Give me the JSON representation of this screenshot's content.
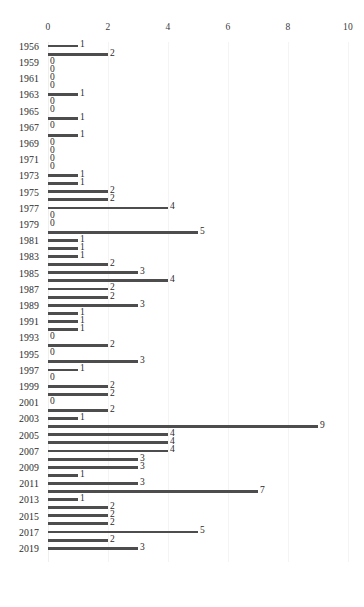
{
  "chart_data": {
    "type": "bar",
    "orientation": "horizontal",
    "title": "",
    "subtitle": "",
    "xlabel": "",
    "ylabel": "",
    "xlim": [
      0,
      10
    ],
    "ylim": null,
    "grid": true,
    "grid_axis": "x",
    "legend": null,
    "legend_position": "none",
    "xticks": [
      0,
      2,
      4,
      6,
      8,
      10
    ],
    "xtick_labels": [
      "0",
      "2",
      "4",
      "6",
      "8",
      "10"
    ],
    "bar_color": "#4d4d4d",
    "gridline_color": "#f4f4f4",
    "axis_color": "#efefef",
    "text_color": "#2b2b2b",
    "categories": [
      "1956",
      "1957",
      "1959",
      "1960",
      "1961",
      "1962",
      "1963",
      "1964",
      "1965",
      "1966",
      "1967",
      "1968",
      "1969",
      "1970",
      "1971",
      "1972",
      "1973",
      "1974",
      "1975",
      "1976",
      "1977",
      "1978",
      "1979",
      "1980",
      "1981",
      "1982",
      "1983",
      "1984",
      "1985",
      "1986",
      "1987",
      "1988",
      "1989",
      "1990",
      "1991",
      "1992",
      "1993",
      "1994",
      "1995",
      "1996",
      "1997",
      "1998",
      "1999",
      "2000",
      "2001",
      "2002",
      "2003",
      "2004",
      "2005",
      "2006",
      "2007",
      "2008",
      "2009",
      "2010",
      "2011",
      "2012",
      "2013",
      "2014",
      "2015",
      "2016",
      "2017",
      "2018",
      "2019"
    ],
    "values": [
      1,
      2,
      0,
      0,
      0,
      0,
      1,
      0,
      0,
      1,
      0,
      1,
      0,
      0,
      0,
      0,
      1,
      1,
      2,
      2,
      4,
      0,
      0,
      5,
      1,
      1,
      1,
      2,
      3,
      4,
      2,
      2,
      3,
      1,
      1,
      1,
      0,
      2,
      0,
      3,
      1,
      0,
      2,
      2,
      0,
      2,
      1,
      9,
      4,
      4,
      4,
      3,
      3,
      1,
      3,
      7,
      1,
      2,
      2,
      2,
      5,
      2,
      3
    ],
    "tick_label_indices": [
      0,
      2,
      4,
      6,
      8,
      10,
      12,
      14,
      16,
      18,
      20,
      22,
      24,
      26,
      28,
      30,
      32,
      34,
      36,
      38,
      40,
      42,
      44,
      46,
      48,
      50,
      52,
      54,
      56,
      58,
      60,
      62
    ],
    "data_labels_shown": true
  }
}
